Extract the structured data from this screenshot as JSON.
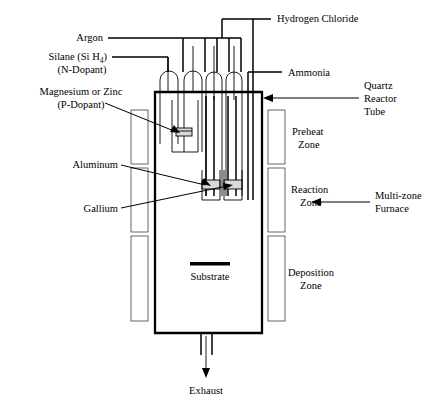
{
  "diagram": {
    "colors": {
      "line": "#000000",
      "furnace_hatch": "#555555",
      "boat_fill": "#d9d9d9",
      "background": "#ffffff"
    }
  },
  "labels": {
    "argon": "Argon",
    "silane_line1": "Silane (Si H",
    "silane_sub": "4",
    "silane_line1_end": ")",
    "silane_line2": "(N-Dopant)",
    "magnesium_line1": "Magnesium or Zinc",
    "magnesium_line2": "(P-Dopant)",
    "aluminum": "Aluminum",
    "gallium": "Gallium",
    "hydrogen_chloride": "Hydrogen Chloride",
    "ammonia": "Ammonia",
    "quartz_line1": "Quartz",
    "quartz_line2": "Reactor",
    "quartz_line3": "Tube",
    "preheat_line1": "Preheat",
    "preheat_line2": "Zone",
    "reaction_line1": "Reaction",
    "reaction_line2": "Zone",
    "deposition_line1": "Deposition",
    "deposition_line2": "Zone",
    "multizone_line1": "Multi-zone",
    "multizone_line2": "Furnace",
    "substrate": "Substrate",
    "exhaust": "Exhaust"
  },
  "zones": [
    {
      "name": "preheat",
      "line1": "Preheat",
      "line2": "Zone"
    },
    {
      "name": "reaction",
      "line1": "Reaction",
      "line2": "Zone"
    },
    {
      "name": "deposition",
      "line1": "Deposition",
      "line2": "Zone"
    }
  ],
  "inlets": [
    {
      "name": "argon",
      "label": "Argon"
    },
    {
      "name": "silane",
      "label": "Silane (Si H4) (N-Dopant)"
    },
    {
      "name": "hydrogen-chloride",
      "label": "Hydrogen Chloride"
    },
    {
      "name": "ammonia",
      "label": "Ammonia"
    }
  ],
  "sources": [
    {
      "name": "magnesium-zinc",
      "label": "Magnesium or Zinc (P-Dopant)"
    },
    {
      "name": "aluminum",
      "label": "Aluminum"
    },
    {
      "name": "gallium",
      "label": "Gallium"
    }
  ]
}
